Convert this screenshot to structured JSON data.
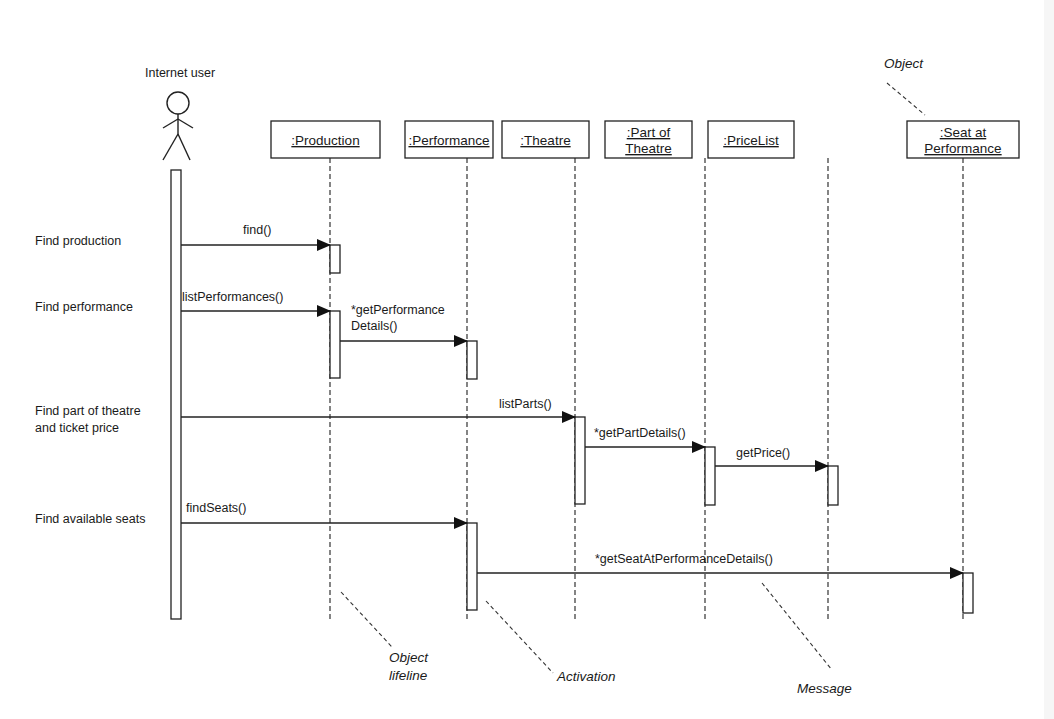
{
  "diagram": {
    "type": "UML sequence diagram",
    "actor": {
      "label": "Internet user",
      "x": 176
    },
    "objects": [
      {
        "id": "production",
        "lines": [
          ":Production"
        ],
        "x": 271,
        "w": 109,
        "lifeline_x": 330
      },
      {
        "id": "performance",
        "lines": [
          ":Performance"
        ],
        "x": 405,
        "w": 88,
        "lifeline_x": 467
      },
      {
        "id": "theatre",
        "lines": [
          ":Theatre"
        ],
        "x": 502,
        "w": 87,
        "lifeline_x": 575
      },
      {
        "id": "part-of-theatre",
        "lines": [
          ":Part of",
          "Theatre"
        ],
        "x": 605,
        "w": 87,
        "lifeline_x": 705
      },
      {
        "id": "pricelist",
        "lines": [
          ":PriceList"
        ],
        "x": 708,
        "w": 86,
        "lifeline_x": 828
      },
      {
        "id": "seat-at-performance",
        "lines": [
          ":Seat at",
          "Performance"
        ],
        "x": 907,
        "w": 112,
        "lifeline_x": 963
      }
    ],
    "steps": [
      {
        "label": "Find production",
        "y": 241
      },
      {
        "label": "Find performance",
        "y": 307
      },
      {
        "label_lines": [
          "Find part of theatre",
          "and ticket price"
        ],
        "y": 415
      },
      {
        "label": "Find available seats",
        "y": 519
      }
    ],
    "messages": [
      {
        "label": "find()",
        "from_x": 181,
        "to_x": 330,
        "y": 245,
        "label_x": 243,
        "label_y": 234
      },
      {
        "label": "listPerformances()",
        "from_x": 181,
        "to_x": 330,
        "y": 311,
        "label_x": 182,
        "label_y": 301
      },
      {
        "label_lines": [
          "*getPerformance",
          "Details()"
        ],
        "from_x": 340,
        "to_x": 467,
        "y": 341,
        "label_x": 351,
        "label_y": 314
      },
      {
        "label": "listParts()",
        "from_x": 181,
        "to_x": 575,
        "y": 417,
        "label_x": 499,
        "label_y": 408
      },
      {
        "label": "*getPartDetails()",
        "from_x": 585,
        "to_x": 705,
        "y": 447,
        "label_x": 594,
        "label_y": 437
      },
      {
        "label": "getPrice()",
        "from_x": 715,
        "to_x": 828,
        "y": 466,
        "label_x": 736,
        "label_y": 457
      },
      {
        "label": "findSeats()",
        "from_x": 181,
        "to_x": 467,
        "y": 523,
        "label_x": 186,
        "label_y": 512
      },
      {
        "label": "*getSeatAtPerformanceDetails()",
        "from_x": 477,
        "to_x": 963,
        "y": 573,
        "label_x": 595,
        "label_y": 563
      }
    ],
    "activations": [
      {
        "owner": "internet-user",
        "x": 171,
        "y1": 170,
        "y2": 619
      },
      {
        "owner": "production",
        "x": 330,
        "y1": 245,
        "y2": 273
      },
      {
        "owner": "production",
        "x": 330,
        "y1": 311,
        "y2": 378
      },
      {
        "owner": "performance",
        "x": 467,
        "y1": 341,
        "y2": 379
      },
      {
        "owner": "theatre",
        "x": 575,
        "y1": 417,
        "y2": 504
      },
      {
        "owner": "part-of-theatre",
        "x": 705,
        "y1": 447,
        "y2": 505
      },
      {
        "owner": "pricelist",
        "x": 828,
        "y1": 466,
        "y2": 505
      },
      {
        "owner": "performance",
        "x": 467,
        "y1": 523,
        "y2": 610
      },
      {
        "owner": "seat-at-performance",
        "x": 963,
        "y1": 573,
        "y2": 613
      }
    ],
    "annotations": [
      {
        "id": "object",
        "lines": [
          "Object"
        ],
        "x": 884,
        "y": 68,
        "leader": [
          887,
          83,
          925,
          115
        ]
      },
      {
        "id": "object-lifeline",
        "lines": [
          "Object",
          "lifeline"
        ],
        "x": 389,
        "y": 662,
        "leader": [
          341,
          592,
          392,
          647
        ]
      },
      {
        "id": "activation",
        "lines": [
          "Activation"
        ],
        "x": 557,
        "y": 681,
        "leader": [
          486,
          601,
          553,
          673
        ]
      },
      {
        "id": "message",
        "lines": [
          "Message"
        ],
        "x": 797,
        "y": 693,
        "leader": [
          762,
          583,
          832,
          670
        ]
      }
    ],
    "lifeline_end_y": 620,
    "colors": {
      "line": "#222222",
      "background": "#ffffff"
    }
  }
}
